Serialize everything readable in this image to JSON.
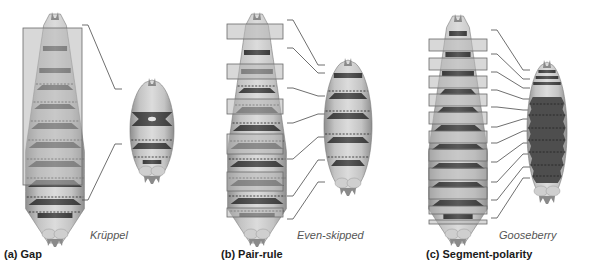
{
  "figure": {
    "panels": [
      {
        "id": "a",
        "label": "(a) Gap",
        "gene": "Krüppel",
        "label_pos": [
          4,
          248
        ],
        "gene_pos": [
          90,
          229
        ],
        "embryo": {
          "cx": 55,
          "top": 14,
          "bottom": 243,
          "halfwidth": 30
        },
        "bands": [
          {
            "y": 46,
            "h": 5,
            "w": 0.82,
            "dark": true
          },
          {
            "y": 68,
            "h": 5,
            "w": 0.88,
            "dark": true
          },
          {
            "y": 85,
            "h": 5,
            "w": 0.9,
            "dark": true,
            "trap": true
          },
          {
            "y": 104,
            "h": 5,
            "w": 0.9,
            "dark": true,
            "trap": true
          },
          {
            "y": 123,
            "h": 6,
            "w": 0.92,
            "dark": true,
            "trap": true
          },
          {
            "y": 142,
            "h": 6,
            "w": 0.92,
            "dark": true,
            "trap": true
          },
          {
            "y": 161,
            "h": 6,
            "w": 0.92,
            "dark": true,
            "trap": true
          },
          {
            "y": 180,
            "h": 7,
            "w": 0.92,
            "dark": true,
            "trap": true
          },
          {
            "y": 199,
            "h": 6,
            "w": 0.9,
            "dark": true,
            "trap": true
          },
          {
            "y": 213,
            "h": 5,
            "w": 0.7,
            "dark": true
          }
        ],
        "dashes": [
          84,
          102,
          121,
          140,
          159,
          178,
          197,
          212
        ],
        "boxes": [
          {
            "x": 23,
            "y": 28,
            "w": 59,
            "h": 157
          }
        ],
        "side_embryo": {
          "cx": 152,
          "top": 80,
          "bottom": 180,
          "halfwidth": 22,
          "bands": [
            {
              "y": 112,
              "h": 14,
              "w": 0.95,
              "hourglass": true,
              "hole": true
            },
            {
              "y": 143,
              "h": 6,
              "w": 0.95,
              "trap": true
            },
            {
              "y": 160,
              "h": 4,
              "w": 0.55
            }
          ],
          "dashes": [
            140,
            157
          ]
        },
        "leaders": [
          {
            "points": [
              [
                82,
                25
              ],
              [
                88,
                25
              ],
              [
                115,
                89
              ],
              [
                122,
                89
              ]
            ]
          },
          {
            "points": [
              [
                82,
                200
              ],
              [
                88,
                200
              ],
              [
                115,
                144
              ],
              [
                122,
                144
              ]
            ]
          }
        ]
      },
      {
        "id": "b",
        "label": "(b) Pair-rule",
        "gene": "Even-skipped",
        "label_pos": [
          221,
          248
        ],
        "gene_pos": [
          297,
          229
        ],
        "embryo": {
          "cx": 257,
          "top": 14,
          "bottom": 243,
          "halfwidth": 30
        },
        "bands": [
          {
            "y": 50,
            "h": 5,
            "w": 0.85,
            "dark": true
          },
          {
            "y": 69,
            "h": 5,
            "w": 0.88,
            "dark": true
          },
          {
            "y": 88,
            "h": 5,
            "w": 0.9,
            "dark": true,
            "trap": true
          },
          {
            "y": 107,
            "h": 6,
            "w": 0.9,
            "dark": true,
            "trap": true
          },
          {
            "y": 125,
            "h": 6,
            "w": 0.92,
            "dark": true,
            "trap": true
          },
          {
            "y": 143,
            "h": 6,
            "w": 0.92,
            "dark": true,
            "trap": true
          },
          {
            "y": 161,
            "h": 6,
            "w": 0.92,
            "dark": true,
            "trap": true
          },
          {
            "y": 180,
            "h": 6,
            "w": 0.92,
            "dark": true,
            "trap": true
          },
          {
            "y": 198,
            "h": 6,
            "w": 0.9,
            "dark": true,
            "trap": true
          },
          {
            "y": 213,
            "h": 4,
            "w": 0.7,
            "dark": true
          }
        ],
        "dashes": [
          86,
          105,
          123,
          141,
          159,
          178,
          196,
          211
        ],
        "boxes": [
          {
            "x": 227,
            "y": 24,
            "w": 56,
            "h": 15
          },
          {
            "x": 227,
            "y": 64,
            "w": 56,
            "h": 15
          },
          {
            "x": 227,
            "y": 99,
            "w": 56,
            "h": 15
          },
          {
            "x": 227,
            "y": 134,
            "w": 56,
            "h": 20
          },
          {
            "x": 227,
            "y": 172,
            "w": 56,
            "h": 19
          },
          {
            "x": 227,
            "y": 208,
            "w": 56,
            "h": 9
          }
        ],
        "side_embryo": {
          "cx": 348,
          "top": 60,
          "bottom": 192,
          "halfwidth": 24,
          "bands": [
            {
              "y": 73,
              "h": 5,
              "w": 0.92
            },
            {
              "y": 93,
              "h": 6,
              "w": 0.9,
              "trap": true
            },
            {
              "y": 113,
              "h": 6,
              "w": 0.9,
              "trap": true
            },
            {
              "y": 137,
              "h": 6,
              "w": 0.9,
              "trap": true
            },
            {
              "y": 160,
              "h": 6,
              "w": 0.85,
              "trap": true
            }
          ],
          "dashes": [
            91,
            111,
            134,
            157
          ]
        },
        "leaders": [
          {
            "points": [
              [
                287,
                20
              ],
              [
                293,
                20
              ],
              [
                318,
                65
              ],
              [
                325,
                65
              ]
            ]
          },
          {
            "points": [
              [
                287,
                48
              ],
              [
                293,
                48
              ],
              [
                318,
                73
              ],
              [
                325,
                73
              ]
            ]
          },
          {
            "points": [
              [
                287,
                88
              ],
              [
                293,
                88
              ],
              [
                318,
                96
              ],
              [
                325,
                96
              ]
            ]
          },
          {
            "points": [
              [
                287,
                123
              ],
              [
                293,
                123
              ],
              [
                318,
                114
              ],
              [
                325,
                114
              ]
            ]
          },
          {
            "points": [
              [
                287,
                159
              ],
              [
                293,
                159
              ],
              [
                318,
                137
              ],
              [
                325,
                137
              ]
            ]
          },
          {
            "points": [
              [
                287,
                196
              ],
              [
                293,
                196
              ],
              [
                318,
                160
              ],
              [
                325,
                160
              ]
            ]
          },
          {
            "points": [
              [
                287,
                219
              ],
              [
                293,
                219
              ],
              [
                318,
                182
              ],
              [
                325,
                182
              ]
            ]
          }
        ]
      },
      {
        "id": "c",
        "label": "(c) Segment-polarity",
        "gene": "Gooseberry",
        "label_pos": [
          426,
          248
        ],
        "gene_pos": [
          499,
          229
        ],
        "embryo": {
          "cx": 458,
          "top": 16,
          "bottom": 243,
          "halfwidth": 30
        },
        "bands": [
          {
            "y": 31,
            "h": 5,
            "w": 0.72,
            "dark": true
          },
          {
            "y": 52,
            "h": 5,
            "w": 0.82,
            "dark": true
          },
          {
            "y": 71,
            "h": 5,
            "w": 0.88,
            "dark": true
          },
          {
            "y": 89,
            "h": 6,
            "w": 0.9,
            "dark": true,
            "trap": true
          },
          {
            "y": 107,
            "h": 6,
            "w": 0.9,
            "dark": true,
            "trap": true
          },
          {
            "y": 125,
            "h": 6,
            "w": 0.92,
            "dark": true,
            "trap": true
          },
          {
            "y": 144,
            "h": 6,
            "w": 0.92,
            "dark": true,
            "trap": true
          },
          {
            "y": 163,
            "h": 6,
            "w": 0.92,
            "dark": true,
            "trap": true
          },
          {
            "y": 182,
            "h": 6,
            "w": 0.92,
            "dark": true,
            "trap": true
          },
          {
            "y": 200,
            "h": 6,
            "w": 0.88,
            "dark": true,
            "trap": true
          },
          {
            "y": 214,
            "h": 5,
            "w": 0.6,
            "dark": true
          }
        ],
        "dashes": [],
        "boxes": [
          {
            "x": 429,
            "y": 39,
            "w": 58,
            "h": 12
          },
          {
            "x": 429,
            "y": 58,
            "w": 58,
            "h": 12
          },
          {
            "x": 429,
            "y": 76,
            "w": 58,
            "h": 12
          },
          {
            "x": 429,
            "y": 94,
            "w": 58,
            "h": 12
          },
          {
            "x": 429,
            "y": 112,
            "w": 58,
            "h": 12
          },
          {
            "x": 429,
            "y": 131,
            "w": 58,
            "h": 12
          },
          {
            "x": 429,
            "y": 149,
            "w": 58,
            "h": 12
          },
          {
            "x": 429,
            "y": 168,
            "w": 58,
            "h": 12
          },
          {
            "x": 429,
            "y": 187,
            "w": 58,
            "h": 12
          },
          {
            "x": 429,
            "y": 206,
            "w": 58,
            "h": 8
          },
          {
            "x": 429,
            "y": 220,
            "w": 58,
            "h": 4
          }
        ],
        "side_embryo": {
          "cx": 547,
          "top": 62,
          "bottom": 200,
          "halfwidth": 20,
          "bands": [
            {
              "y": 70,
              "h": 3,
              "w": 0.85
            },
            {
              "y": 76,
              "h": 3,
              "w": 0.9
            },
            {
              "y": 82,
              "h": 3,
              "w": 0.95
            }
          ],
          "block": {
            "top": 97,
            "bottom": 183,
            "w": 0.82,
            "wavy": true
          },
          "dashes": [
            104,
            115,
            128,
            140,
            152,
            165,
            176
          ]
        },
        "leaders": [
          {
            "points": [
              [
                491,
                30
              ],
              [
                497,
                30
              ],
              [
                523,
                70
              ],
              [
                530,
                70
              ]
            ]
          },
          {
            "points": [
              [
                491,
                54
              ],
              [
                497,
                54
              ],
              [
                523,
                79
              ],
              [
                530,
                79
              ]
            ]
          },
          {
            "points": [
              [
                491,
                72
              ],
              [
                497,
                72
              ],
              [
                523,
                88
              ],
              [
                530,
                88
              ]
            ]
          },
          {
            "points": [
              [
                491,
                90
              ],
              [
                497,
                90
              ],
              [
                523,
                99
              ],
              [
                530,
                99
              ]
            ]
          },
          {
            "points": [
              [
                491,
                107
              ],
              [
                497,
                107
              ],
              [
                523,
                110
              ],
              [
                530,
                110
              ]
            ]
          },
          {
            "points": [
              [
                491,
                127
              ],
              [
                497,
                127
              ],
              [
                523,
                119
              ],
              [
                530,
                119
              ]
            ]
          },
          {
            "points": [
              [
                491,
                143
              ],
              [
                497,
                143
              ],
              [
                523,
                131
              ],
              [
                530,
                131
              ]
            ]
          },
          {
            "points": [
              [
                491,
                162
              ],
              [
                497,
                162
              ],
              [
                523,
                143
              ],
              [
                530,
                143
              ]
            ]
          },
          {
            "points": [
              [
                491,
                182
              ],
              [
                497,
                182
              ],
              [
                523,
                154
              ],
              [
                530,
                154
              ]
            ]
          },
          {
            "points": [
              [
                491,
                200
              ],
              [
                497,
                200
              ],
              [
                523,
                167
              ],
              [
                530,
                167
              ]
            ]
          },
          {
            "points": [
              [
                491,
                218
              ],
              [
                497,
                218
              ],
              [
                523,
                178
              ],
              [
                530,
                178
              ]
            ]
          }
        ]
      }
    ],
    "colors": {
      "body_light": "#d8d8d8",
      "body_mid": "#b4b4b4",
      "body_dark": "#8e8e8e",
      "band": "#4a4a4a",
      "band_dark": "#3a3a3a",
      "box_fill": "#b8b8b8",
      "box_stroke": "#6a6a6a",
      "leader": "#4a4a4a",
      "dash": "#222222"
    }
  }
}
